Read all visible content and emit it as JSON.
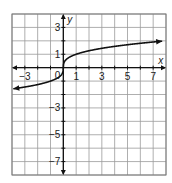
{
  "chart_data": {
    "type": "line",
    "title": "",
    "xlabel": "x",
    "ylabel": "y",
    "xlim": [
      -4,
      8
    ],
    "ylim": [
      -8,
      4
    ],
    "grid": true,
    "x_ticks": [
      {
        "value": -3,
        "label": "−3"
      },
      {
        "value": 1,
        "label": "1"
      },
      {
        "value": 3,
        "label": "3"
      },
      {
        "value": 5,
        "label": "5"
      },
      {
        "value": 7,
        "label": "7"
      }
    ],
    "y_ticks": [
      {
        "value": 3,
        "label": "3"
      },
      {
        "value": 1,
        "label": "1"
      },
      {
        "value": -3,
        "label": "−3"
      },
      {
        "value": -5,
        "label": "−5"
      },
      {
        "value": -7,
        "label": "−7"
      }
    ],
    "origin_label": "0",
    "series": [
      {
        "name": "y = cube root of x",
        "function": "cbrt(x)",
        "domain": [
          -3.9,
          7.7
        ],
        "arrows": "both",
        "points": [
          {
            "x": -3.9,
            "y": -1.57
          },
          {
            "x": -3,
            "y": -1.44
          },
          {
            "x": -2,
            "y": -1.26
          },
          {
            "x": -1,
            "y": -1.0
          },
          {
            "x": -0.125,
            "y": -0.5
          },
          {
            "x": 0,
            "y": 0
          },
          {
            "x": 0.125,
            "y": 0.5
          },
          {
            "x": 1,
            "y": 1.0
          },
          {
            "x": 3,
            "y": 1.44
          },
          {
            "x": 5,
            "y": 1.71
          },
          {
            "x": 7,
            "y": 1.91
          },
          {
            "x": 7.7,
            "y": 1.97
          }
        ]
      }
    ],
    "legend": null
  }
}
